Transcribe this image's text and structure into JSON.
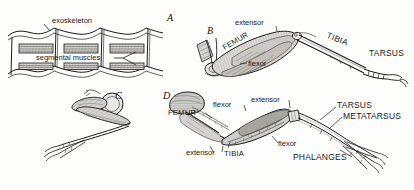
{
  "figure": {
    "background_color": "#fdfdfc",
    "ink_color": "#1b1b1b",
    "muscle_fill": "#d8d6d2",
    "shade_fill": "#bfbcb7"
  },
  "panels": [
    {
      "id": "A",
      "name": "segmented-body-wall",
      "labels": [
        {
          "key": "exoskeleton",
          "text": "exoskeleton"
        },
        {
          "key": "segmental_muscles",
          "text": "segmental muscles"
        }
      ]
    },
    {
      "id": "B",
      "name": "insect-leg",
      "labels": [
        {
          "key": "extensor",
          "text": "extensor"
        },
        {
          "key": "flexor",
          "text": "flexor"
        },
        {
          "key": "femur",
          "text": "FEMUR"
        },
        {
          "key": "tibia",
          "text": "TIBIA"
        },
        {
          "key": "tarsus",
          "text": "TARSUS"
        }
      ]
    },
    {
      "id": "C",
      "name": "folded-limb",
      "labels": []
    },
    {
      "id": "D",
      "name": "vertebrate-leg",
      "labels": [
        {
          "key": "femur",
          "text": "FEMUR"
        },
        {
          "key": "flexor_upper",
          "text": "flexor"
        },
        {
          "key": "extensor_lower",
          "text": "extensor"
        },
        {
          "key": "extensor_upper",
          "text": "extensor"
        },
        {
          "key": "flexor_lower",
          "text": "flexor"
        },
        {
          "key": "tibia",
          "text": "TIBIA"
        },
        {
          "key": "tarsus",
          "text": "TARSUS"
        },
        {
          "key": "metatarsus",
          "text": "METATARSUS"
        },
        {
          "key": "phalanges",
          "text": "PHALANGES"
        }
      ]
    }
  ],
  "panel_ids": {
    "a": "A",
    "b": "B",
    "c": "C",
    "d": "D"
  }
}
